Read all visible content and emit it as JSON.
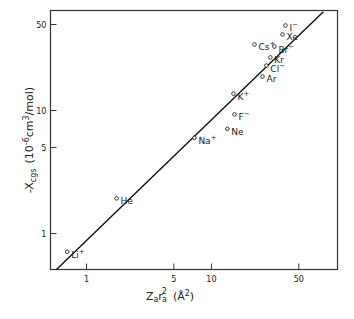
{
  "chart_data": {
    "type": "scatter",
    "title": "",
    "xlabel": "Z_a r_a^2 (Å^2)",
    "xlabel_main": "Z",
    "xlabel_sub1": "a",
    "xlabel_r": "r",
    "xlabel_sub2": "a",
    "xlabel_sup": "2",
    "xlabel_unit": "(Å",
    "xlabel_unit_sup": "2",
    "xlabel_unit_close": ")",
    "ylabel": "-X_cgs (10^-6 cm^3/mol)",
    "ylabel_main": "-X",
    "ylabel_sub": "cgs",
    "ylabel_unit_a": "(10",
    "ylabel_unit_exp": "-6",
    "ylabel_unit_b": "cm",
    "ylabel_unit_exp2": "3",
    "ylabel_unit_c": "/mol)",
    "xscale": "log",
    "yscale": "log",
    "xlim": [
      0.515,
      102
    ],
    "ylim": [
      0.51,
      65
    ],
    "xticks": [
      1,
      5,
      10,
      50
    ],
    "xtick_labels": [
      "1",
      "5",
      "10",
      "50"
    ],
    "yticks": [
      1,
      5,
      10,
      50
    ],
    "ytick_labels": [
      "1",
      "5",
      "10",
      "50"
    ],
    "grid": false,
    "legend": "none",
    "points": [
      {
        "label": "Li+",
        "label_text": "Li",
        "charge": "+",
        "x": 0.7,
        "y": 0.71
      },
      {
        "label": "He",
        "label_text": "He",
        "charge": "",
        "x": 1.74,
        "y": 1.93
      },
      {
        "label": "Na+",
        "label_text": "Na",
        "charge": "+",
        "x": 7.3,
        "y": 6.0
      },
      {
        "label": "Ne",
        "label_text": "Ne",
        "charge": "",
        "x": 13.4,
        "y": 7.1
      },
      {
        "label": "F-",
        "label_text": "F",
        "charge": "−",
        "x": 15.3,
        "y": 9.3
      },
      {
        "label": "K+",
        "label_text": "K",
        "charge": "+",
        "x": 15.0,
        "y": 13.7
      },
      {
        "label": "Ar",
        "label_text": "Ar",
        "charge": "",
        "x": 25.6,
        "y": 18.9
      },
      {
        "label": "Cl-",
        "label_text": "Cl",
        "charge": "−",
        "x": 27.5,
        "y": 23.2
      },
      {
        "label": "Kr",
        "label_text": "Kr",
        "charge": "",
        "x": 29.6,
        "y": 27.0
      },
      {
        "label": "Cs+",
        "label_text": "Cs",
        "charge": "+",
        "x": 22.1,
        "y": 34.4
      },
      {
        "label": "Br-",
        "label_text": "Br",
        "charge": "−",
        "x": 31.9,
        "y": 33.1
      },
      {
        "label": "Xe",
        "label_text": "Xe",
        "charge": "",
        "x": 37.0,
        "y": 41.5
      },
      {
        "label": "I-",
        "label_text": "I",
        "charge": "−",
        "x": 39.1,
        "y": 49.1
      }
    ],
    "fit_line": {
      "x": [
        0.575,
        78.6
      ],
      "y": [
        0.51,
        63.6
      ]
    }
  }
}
